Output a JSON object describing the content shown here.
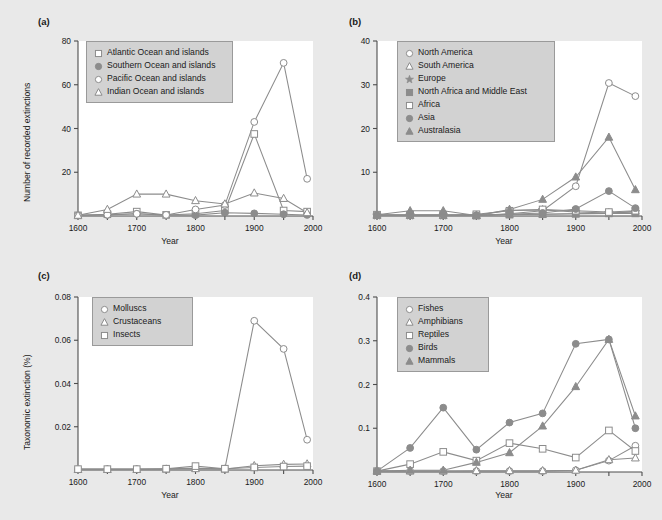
{
  "figure": {
    "background": "#e9e9e9",
    "plot_background": "#ffffff",
    "line_color": "#8c8c8c",
    "marker_fill_color": "#8c8c8c",
    "axis_color": "#4d4d4d",
    "text_color": "#1a1a1a",
    "legend_background": "#d2d2d2",
    "legend_border": "#9a9a9a"
  },
  "panels": [
    {
      "label": "(a)",
      "xlabel": "Year",
      "ylabel": "Number of recorded extinctions",
      "xticks": [
        "1600",
        "1650",
        "1700",
        "1750",
        "1800",
        "1850",
        "1900",
        "1950",
        "2000"
      ],
      "xtick_values": [
        1600,
        1650,
        1700,
        1750,
        1800,
        1850,
        1900,
        1950,
        2000
      ],
      "xticklabels_shown": [
        "1600",
        "1700",
        "1800",
        "1900",
        "2000"
      ],
      "yticks": [
        "0",
        "20",
        "40",
        "60",
        "80"
      ],
      "ytick_values": [
        0,
        20,
        40,
        60,
        80
      ],
      "ylim": [
        0,
        80
      ],
      "xlim": [
        1600,
        2000
      ],
      "legend": [
        {
          "label": "Atlantic Ocean and islands",
          "marker": "open-square"
        },
        {
          "label": "Southern Ocean and islands",
          "marker": "filled-circle"
        },
        {
          "label": "Pacific Ocean and islands",
          "marker": "open-circle"
        },
        {
          "label": "Indian Ocean and islands",
          "marker": "open-triangle"
        }
      ]
    },
    {
      "label": "(b)",
      "xlabel": "Year",
      "ylabel": "",
      "xticks": [
        "1600",
        "1650",
        "1700",
        "1750",
        "1800",
        "1850",
        "1900",
        "1950",
        "2000"
      ],
      "xtick_values": [
        1600,
        1650,
        1700,
        1750,
        1800,
        1850,
        1900,
        1950,
        2000
      ],
      "xticklabels_shown": [
        "1600",
        "1700",
        "1800",
        "1900",
        "2000"
      ],
      "yticks": [
        "0",
        "10",
        "20",
        "30",
        "40"
      ],
      "ytick_values": [
        0,
        10,
        20,
        30,
        40
      ],
      "ylim": [
        0,
        40
      ],
      "xlim": [
        1600,
        2000
      ],
      "legend": [
        {
          "label": "North America",
          "marker": "open-circle"
        },
        {
          "label": "South America",
          "marker": "open-triangle"
        },
        {
          "label": "Europe",
          "marker": "filled-star"
        },
        {
          "label": "North Africa and Middle East",
          "marker": "filled-square"
        },
        {
          "label": "Africa",
          "marker": "open-square"
        },
        {
          "label": "Asia",
          "marker": "filled-circle"
        },
        {
          "label": "Australasia",
          "marker": "filled-triangle"
        }
      ]
    },
    {
      "label": "(c)",
      "xlabel": "Year",
      "ylabel": "Taxonomic extinction (%)",
      "xticks": [
        "1600",
        "1650",
        "1700",
        "1750",
        "1800",
        "1850",
        "1900",
        "1950",
        "2000"
      ],
      "xtick_values": [
        1600,
        1650,
        1700,
        1750,
        1800,
        1850,
        1900,
        1950,
        2000
      ],
      "xticklabels_shown": [
        "1600",
        "1700",
        "1800",
        "1900",
        "2000"
      ],
      "yticks": [
        "0",
        "0.02",
        "0.04",
        "0.06",
        "0.08"
      ],
      "ytick_values": [
        0,
        0.02,
        0.04,
        0.06,
        0.08
      ],
      "ylim": [
        0,
        0.08
      ],
      "xlim": [
        1600,
        2000
      ],
      "legend": [
        {
          "label": "Molluscs",
          "marker": "open-circle"
        },
        {
          "label": "Crustaceans",
          "marker": "open-triangle"
        },
        {
          "label": "Insects",
          "marker": "open-square"
        }
      ]
    },
    {
      "label": "(d)",
      "xlabel": "Year",
      "ylabel": "",
      "xticks": [
        "1600",
        "1650",
        "1700",
        "1750",
        "1800",
        "1850",
        "1900",
        "1950",
        "2000"
      ],
      "xtick_values": [
        1600,
        1650,
        1700,
        1750,
        1800,
        1850,
        1900,
        1950,
        2000
      ],
      "xticklabels_shown": [
        "1600",
        "1700",
        "1800",
        "1900",
        "2000"
      ],
      "yticks": [
        "0",
        "0.1",
        "0.2",
        "0.3",
        "0.4"
      ],
      "ytick_values": [
        0,
        0.1,
        0.2,
        0.3,
        0.4
      ],
      "ylim": [
        0,
        0.4
      ],
      "xlim": [
        1600,
        2000
      ],
      "legend": [
        {
          "label": "Fishes",
          "marker": "open-circle"
        },
        {
          "label": "Amphibians",
          "marker": "open-triangle"
        },
        {
          "label": "Reptiles",
          "marker": "open-square"
        },
        {
          "label": "Birds",
          "marker": "filled-circle"
        },
        {
          "label": "Mammals",
          "marker": "filled-triangle"
        }
      ]
    }
  ],
  "chart_data": [
    {
      "type": "line",
      "panel": "(a)",
      "title": "",
      "xlabel": "Year",
      "ylabel": "Number of recorded extinctions",
      "xlim": [
        1600,
        2000
      ],
      "ylim": [
        0,
        80
      ],
      "grid": false,
      "legend_position": "upper-left",
      "x": [
        1600,
        1650,
        1700,
        1750,
        1800,
        1850,
        1900,
        1950,
        1990
      ],
      "series": [
        {
          "name": "Atlantic Ocean and islands",
          "marker": "open-square",
          "values": [
            0.3,
            0.8,
            2.0,
            0.5,
            1.0,
            2.5,
            37.5,
            2.5,
            2.0
          ]
        },
        {
          "name": "Southern Ocean and islands",
          "marker": "filled-circle",
          "values": [
            0.3,
            0.5,
            1.0,
            0.4,
            0.4,
            1.5,
            1.2,
            0.8,
            0.5
          ]
        },
        {
          "name": "Pacific Ocean and islands",
          "marker": "open-circle",
          "values": [
            0.3,
            0.6,
            1.0,
            0.5,
            3.0,
            5.0,
            43.0,
            70.0,
            17.0
          ]
        },
        {
          "name": "Indian Ocean and islands",
          "marker": "open-triangle",
          "values": [
            0.3,
            3.0,
            10.0,
            10.0,
            7.0,
            5.5,
            10.5,
            8.0,
            1.5
          ]
        }
      ]
    },
    {
      "type": "line",
      "panel": "(b)",
      "title": "",
      "xlabel": "Year",
      "ylabel": "",
      "xlim": [
        1600,
        2000
      ],
      "ylim": [
        0,
        40
      ],
      "grid": false,
      "legend_position": "upper-left",
      "x": [
        1600,
        1650,
        1700,
        1750,
        1800,
        1850,
        1900,
        1950,
        1990
      ],
      "series": [
        {
          "name": "North America",
          "marker": "open-circle",
          "values": [
            0.1,
            0.1,
            0.1,
            0.1,
            0.5,
            1.2,
            6.8,
            30.4,
            27.4
          ]
        },
        {
          "name": "South America",
          "marker": "open-triangle",
          "values": [
            0.1,
            0.1,
            0.1,
            0.1,
            0.4,
            0.4,
            0.5,
            0.6,
            1.1
          ]
        },
        {
          "name": "Europe",
          "marker": "filled-star",
          "values": [
            0.1,
            0.1,
            0.1,
            0.1,
            1.3,
            1.4,
            0.9,
            0.7,
            0.9
          ]
        },
        {
          "name": "North Africa and Middle East",
          "marker": "filled-square",
          "values": [
            0.3,
            0.3,
            0.3,
            0.1,
            0.3,
            0.4,
            0.5,
            0.6,
            0.6
          ]
        },
        {
          "name": "Africa",
          "marker": "open-square",
          "values": [
            0.2,
            0.2,
            0.2,
            0.4,
            1.2,
            1.5,
            1.2,
            0.9,
            1.2
          ]
        },
        {
          "name": "Asia",
          "marker": "filled-circle",
          "values": [
            0.2,
            0.2,
            0.2,
            0.2,
            0.4,
            0.7,
            1.6,
            5.7,
            1.8
          ]
        },
        {
          "name": "Australasia",
          "marker": "filled-triangle",
          "values": [
            0.3,
            1.2,
            1.2,
            0.1,
            1.5,
            3.8,
            8.9,
            18.0,
            6.0
          ]
        }
      ]
    },
    {
      "type": "line",
      "panel": "(c)",
      "title": "",
      "xlabel": "Year",
      "ylabel": "Taxonomic extinction (%)",
      "xlim": [
        1600,
        2000
      ],
      "ylim": [
        0,
        0.08
      ],
      "grid": false,
      "legend_position": "upper-left",
      "x": [
        1600,
        1650,
        1700,
        1750,
        1800,
        1850,
        1900,
        1950,
        1990
      ],
      "series": [
        {
          "name": "Molluscs",
          "marker": "open-circle",
          "values": [
            0.0004,
            0.0004,
            0.0004,
            0.0006,
            0.0008,
            0.0006,
            0.069,
            0.056,
            0.014
          ]
        },
        {
          "name": "Crustaceans",
          "marker": "open-triangle",
          "values": [
            0.0002,
            0.0002,
            0.0002,
            0.0004,
            0.0006,
            0.0004,
            0.002,
            0.0026,
            0.0028
          ]
        },
        {
          "name": "Insects",
          "marker": "open-square",
          "values": [
            0.0004,
            0.0004,
            0.0004,
            0.0006,
            0.0018,
            0.0006,
            0.0012,
            0.0016,
            0.0018
          ]
        }
      ]
    },
    {
      "type": "line",
      "panel": "(d)",
      "title": "",
      "xlabel": "Year",
      "ylabel": "",
      "xlim": [
        1600,
        2000
      ],
      "ylim": [
        0,
        0.4
      ],
      "grid": false,
      "legend_position": "upper-left",
      "x": [
        1600,
        1650,
        1700,
        1750,
        1800,
        1850,
        1900,
        1950,
        1990
      ],
      "series": [
        {
          "name": "Fishes",
          "marker": "open-circle",
          "values": [
            0.002,
            0.002,
            0.002,
            0.002,
            0.002,
            0.002,
            0.004,
            0.026,
            0.06
          ]
        },
        {
          "name": "Amphibians",
          "marker": "open-triangle",
          "values": [
            0.002,
            0.002,
            0.002,
            0.003,
            0.003,
            0.003,
            0.004,
            0.028,
            0.032
          ]
        },
        {
          "name": "Reptiles",
          "marker": "open-square",
          "values": [
            0.002,
            0.018,
            0.046,
            0.026,
            0.066,
            0.053,
            0.033,
            0.095,
            0.048
          ]
        },
        {
          "name": "Birds",
          "marker": "filled-circle",
          "values": [
            0.002,
            0.055,
            0.147,
            0.051,
            0.113,
            0.134,
            0.293,
            0.303,
            0.1
          ]
        },
        {
          "name": "Mammals",
          "marker": "filled-triangle",
          "values": [
            0.002,
            0.004,
            0.004,
            0.022,
            0.044,
            0.105,
            0.195,
            0.303,
            0.128
          ]
        }
      ]
    }
  ]
}
